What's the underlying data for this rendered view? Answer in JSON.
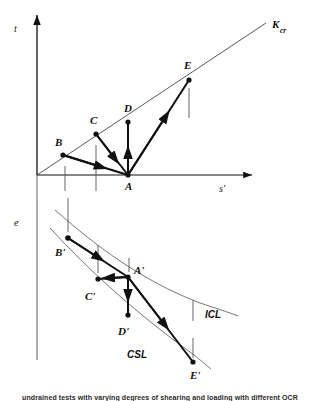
{
  "figure": {
    "type": "diagram",
    "colors": {
      "stroke_dark": "#111111",
      "stroke_thin": "#555555",
      "background": "#ffffff"
    }
  },
  "top_plot": {
    "axes": {
      "y_label": "t",
      "x_label": "s'",
      "origin": {
        "x": 37,
        "y": 175
      }
    },
    "lines": [
      {
        "name": "K_cr",
        "label_main": "K",
        "label_sub": "cr",
        "label_x": 272,
        "label_y": 28
      }
    ],
    "points": [
      {
        "label": "A",
        "x": 128,
        "y": 175,
        "label_x": 125,
        "label_y": 190
      },
      {
        "label": "B",
        "x": 63,
        "y": 155,
        "label_x": 55,
        "label_y": 146
      },
      {
        "label": "C",
        "x": 96,
        "y": 134,
        "label_x": 90,
        "label_y": 124
      },
      {
        "label": "D",
        "x": 128,
        "y": 122,
        "label_x": 124,
        "label_y": 112
      },
      {
        "label": "E",
        "x": 189,
        "y": 80,
        "label_x": 184,
        "label_y": 69
      }
    ],
    "paths": [
      {
        "from": "B",
        "to": "A"
      },
      {
        "from": "C",
        "to": "A"
      },
      {
        "from": "A",
        "to": "D"
      },
      {
        "from": "A",
        "to": "E"
      }
    ]
  },
  "bottom_plot": {
    "axes": {
      "y_label": "e",
      "origin": {
        "x": 37,
        "y": 210
      }
    },
    "lines": [
      {
        "name": "ICL",
        "label": "ICL",
        "label_x": 205,
        "label_y": 318
      },
      {
        "name": "CSL",
        "label": "CSL",
        "label_x": 127,
        "label_y": 358
      }
    ],
    "points": [
      {
        "label": "A'",
        "x": 128,
        "y": 277,
        "label_x": 134,
        "label_y": 274
      },
      {
        "label": "B'",
        "x": 68,
        "y": 238,
        "label_x": 55,
        "label_y": 256
      },
      {
        "label": "C'",
        "x": 98,
        "y": 279,
        "label_x": 85,
        "label_y": 300
      },
      {
        "label": "D'",
        "x": 128,
        "y": 315,
        "label_x": 118,
        "label_y": 335
      },
      {
        "label": "E'",
        "x": 193,
        "y": 362,
        "label_x": 190,
        "label_y": 379
      }
    ],
    "paths": [
      {
        "from": "B'",
        "to": "A'"
      },
      {
        "from": "C'",
        "to": "A'"
      },
      {
        "from": "A'",
        "to": "D'"
      },
      {
        "from": "A'",
        "to": "E'"
      }
    ]
  },
  "caption": {
    "text": "undrained tests with varying degrees of shearing and loading with different OCR"
  }
}
